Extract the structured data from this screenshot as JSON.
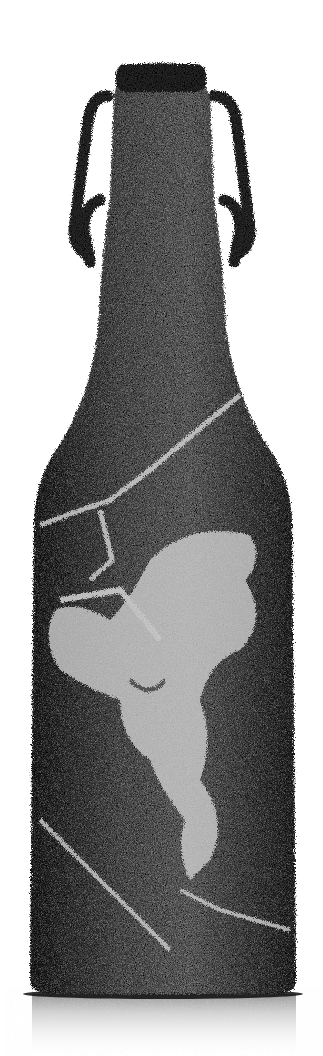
{
  "image": {
    "subject": "Furry textured swing-top bottle",
    "motif": "Light rearing horse figure on bottle body",
    "colors": {
      "background": "#ffffff",
      "fur_dark": "#1e1e1e",
      "fur_mid": "#5a5a5a",
      "fur_light": "#d8d8d8",
      "reflection": "#cfcfcf"
    }
  }
}
